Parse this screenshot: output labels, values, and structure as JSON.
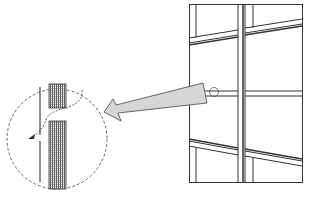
{
  "diagram": {
    "title": "",
    "colors": {
      "line": "#333333",
      "arrow_fill": "#d6d6d6",
      "hatch": "#555555",
      "background": "#ffffff"
    },
    "elements": {
      "frame": "curtain-wall-frame",
      "callout_circle": "detail-callout-circle",
      "arrow": "magnify-arrow",
      "detail": "mullion-joint-detail"
    }
  }
}
